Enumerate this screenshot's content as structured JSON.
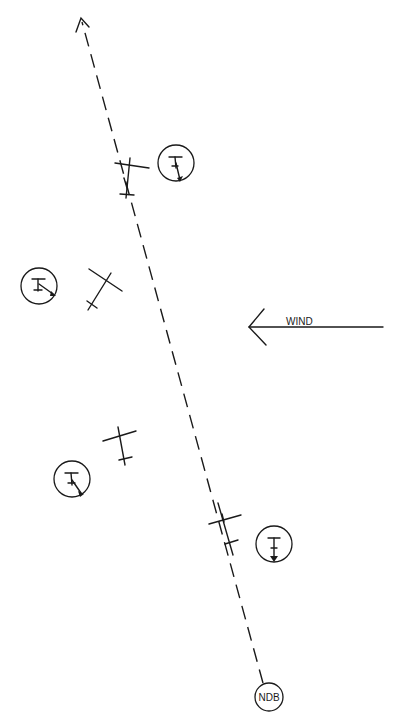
{
  "diagram": {
    "type": "ndb-tracking-wind-drift",
    "course_line": {
      "from": [
        265,
        690
      ],
      "to": [
        80,
        18
      ],
      "style": "dashed",
      "arrowhead": "top"
    },
    "wind": {
      "label": "WIND",
      "direction": "from-right-to-left"
    },
    "ndb": {
      "label": "NDB"
    },
    "aircraft_positions": [
      {
        "id": "pos-1",
        "aircraft": [
          128,
          178
        ],
        "needle_circle": [
          178,
          160
        ],
        "needle_direction": "down-right"
      },
      {
        "id": "pos-2",
        "aircraft": [
          103,
          288
        ],
        "needle_circle": [
          38,
          287
        ],
        "needle_direction": "right-down"
      },
      {
        "id": "pos-3",
        "aircraft": [
          118,
          445
        ],
        "needle_circle": [
          72,
          480
        ],
        "needle_direction": "down-right"
      },
      {
        "id": "pos-4",
        "aircraft": [
          225,
          520
        ],
        "needle_circle": [
          275,
          545
        ],
        "needle_direction": "down"
      }
    ]
  },
  "caption": {
    "text": ""
  }
}
